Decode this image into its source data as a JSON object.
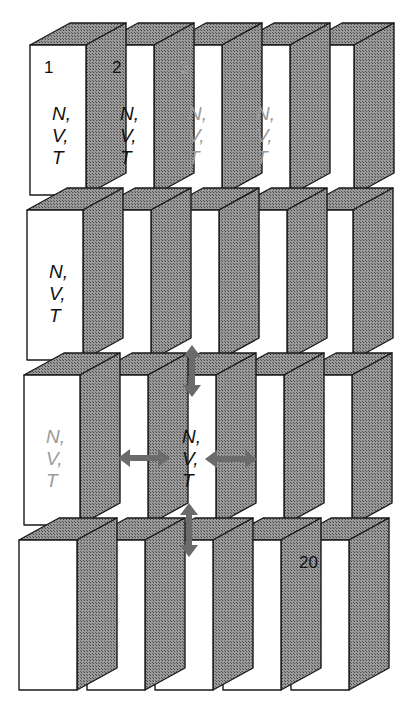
{
  "diagram": {
    "title": "",
    "grid": {
      "rows": 4,
      "cols": 5
    },
    "colors": {
      "face": "#ffffff",
      "side": "#8a8a8a",
      "edge": "#1a1a1a",
      "arrow": "#6b6b6b",
      "faded_text": "#9a9a9a",
      "text": "#111111"
    },
    "cells": [
      {
        "index": 1,
        "row": 0,
        "col": 0,
        "number": "1",
        "vars": [
          "N,",
          "V,",
          "T"
        ],
        "faded": false
      },
      {
        "index": 2,
        "row": 0,
        "col": 1,
        "number": "2",
        "vars": [
          "N,",
          "V,",
          "T"
        ],
        "faded": false
      },
      {
        "index": 3,
        "row": 0,
        "col": 2,
        "number": "3",
        "vars": [
          "N,",
          "V,",
          "T"
        ],
        "faded": true
      },
      {
        "index": 4,
        "row": 0,
        "col": 3,
        "number": "",
        "vars": [
          "N,",
          "V,",
          "T"
        ],
        "faded": true
      },
      {
        "index": 5,
        "row": 0,
        "col": 4,
        "number": "",
        "vars": [],
        "faded": false
      },
      {
        "index": 6,
        "row": 1,
        "col": 0,
        "number": "",
        "vars": [
          "N,",
          "V,",
          "T"
        ],
        "faded": false
      },
      {
        "index": 11,
        "row": 2,
        "col": 0,
        "number": "",
        "vars": [
          "N,",
          "V,",
          "T"
        ],
        "faded": true
      },
      {
        "index": 13,
        "row": 2,
        "col": 2,
        "number": "",
        "vars": [
          "N,",
          "V,",
          "T"
        ],
        "faded": false
      },
      {
        "index": 20,
        "row": 3,
        "col": 4,
        "number": "20",
        "vars": [],
        "faded": false
      }
    ],
    "arrows": [
      {
        "name": "arrow-up-down-top",
        "direction": "vertical"
      },
      {
        "name": "arrow-left-right-left",
        "direction": "horizontal"
      },
      {
        "name": "arrow-left-right-right",
        "direction": "horizontal"
      },
      {
        "name": "arrow-up-down-bottom",
        "direction": "vertical"
      }
    ]
  }
}
